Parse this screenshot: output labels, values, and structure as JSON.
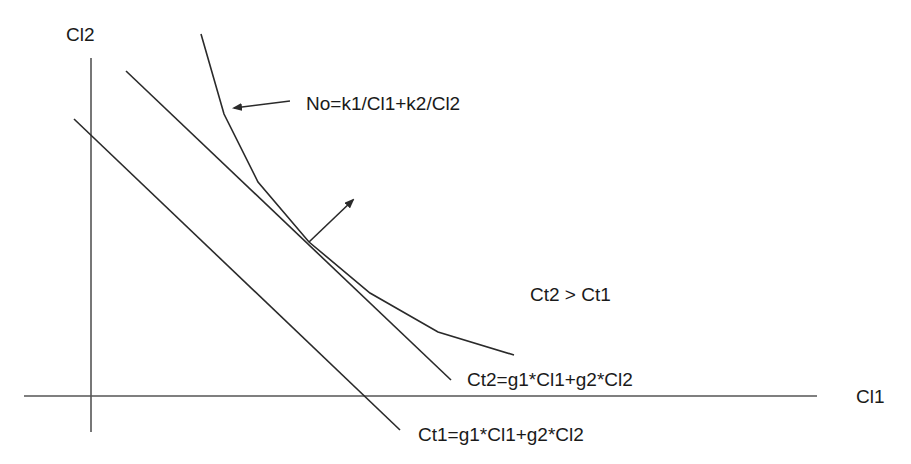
{
  "diagram": {
    "axes": {
      "x_label": "Cl1",
      "y_label": "Cl2"
    },
    "curve_label": "No=k1/Cl1+k2/Cl2",
    "region_label": "Ct2 > Ct1",
    "line_ct2_label": "Ct2=g1*Cl1+g2*Cl2",
    "line_ct1_label": "Ct1=g1*Cl1+g2*Cl2",
    "colors": {
      "line": "#2a2a2a",
      "axis": "#555555",
      "background": "#ffffff"
    }
  }
}
